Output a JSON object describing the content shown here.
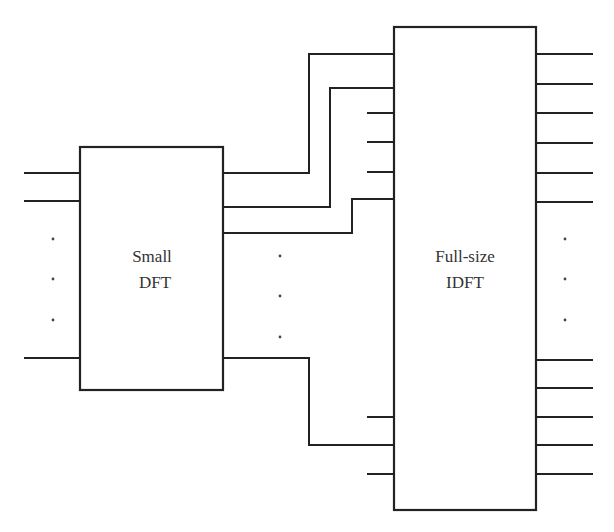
{
  "diagram": {
    "type": "block-diagram",
    "blocks": [
      {
        "id": "small_dft",
        "line1": "Small",
        "line2": "DFT"
      },
      {
        "id": "full_idft",
        "line1": "Full-size",
        "line2": "IDFT"
      }
    ],
    "continuation_marks": [
      ".",
      ".",
      "."
    ]
  },
  "colors": {
    "stroke": "#222222",
    "background": "#ffffff"
  }
}
